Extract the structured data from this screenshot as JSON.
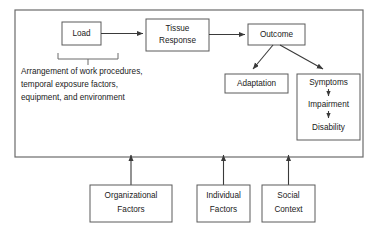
{
  "diagram": {
    "colors": {
      "background": "#ffffff",
      "box_border": "#5a5a5a",
      "outer_border": "#6b6b6b",
      "line": "#3a3a3a",
      "text": "#1a1a1a"
    },
    "nodes": {
      "load": {
        "label": "Load"
      },
      "tissue_response": {
        "line1": "Tissue",
        "line2": "Response"
      },
      "outcome": {
        "label": "Outcome"
      },
      "adaptation": {
        "label": "Adaptation"
      },
      "symptoms": {
        "label": "Symptoms"
      },
      "impairment": {
        "label": "Impairment"
      },
      "disability": {
        "label": "Disability"
      },
      "organizational_factors": {
        "line1": "Organizational",
        "line2": "Factors"
      },
      "individual_factors": {
        "line1": "Individual",
        "line2": "Factors"
      },
      "social_context": {
        "line1": "Social",
        "line2": "Context"
      }
    },
    "annotation": {
      "line1": "Arrangement of work procedures,",
      "line2": "temporal exposure factors,",
      "line3": "equipment, and environment"
    }
  }
}
